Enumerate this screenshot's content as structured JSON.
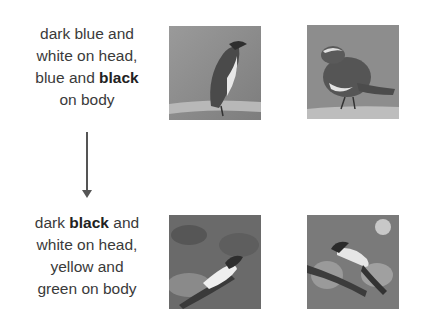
{
  "rows": [
    {
      "caption": {
        "line1": "dark blue and",
        "line2": "white on head,",
        "line3_pre": "blue and ",
        "line3_bold": "black",
        "line4": "on body"
      },
      "images": [
        {
          "label": "bird-photo-perched-blue-white"
        },
        {
          "label": "bird-photo-perched-blue-black"
        }
      ]
    },
    {
      "caption": {
        "line1_pre": "dark ",
        "line1_bold": "black",
        "line1_post": " and",
        "line2": "white on head,",
        "line3": "yellow and",
        "line4": "green on body"
      },
      "images": [
        {
          "label": "bird-photo-black-yellow-green"
        },
        {
          "label": "bird-photo-black-yellow-green-branch"
        }
      ]
    }
  ],
  "arrow": {
    "direction": "down",
    "color": "#555555"
  }
}
